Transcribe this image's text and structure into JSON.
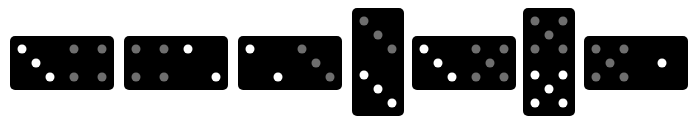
{
  "colors": {
    "tile": "#000000",
    "pip_white": "#ffffff",
    "pip_gray": "#6e6e6e",
    "background": "#ffffff"
  },
  "dominoes": [
    {
      "orientation": "horizontal",
      "x": 10,
      "y": 36,
      "halves": [
        {
          "value": 3,
          "color": "white"
        },
        {
          "value": 4,
          "color": "gray"
        }
      ]
    },
    {
      "orientation": "horizontal",
      "x": 124,
      "y": 36,
      "halves": [
        {
          "value": 4,
          "color": "gray"
        },
        {
          "value": 2,
          "color": "white"
        }
      ]
    },
    {
      "orientation": "horizontal",
      "x": 238,
      "y": 36,
      "halves": [
        {
          "value": 2,
          "color": "white"
        },
        {
          "value": 3,
          "color": "gray"
        }
      ]
    },
    {
      "orientation": "vertical",
      "x": 352,
      "y": 8,
      "halves": [
        {
          "value": 3,
          "color": "gray"
        },
        {
          "value": 3,
          "color": "white"
        }
      ]
    },
    {
      "orientation": "horizontal",
      "x": 412,
      "y": 36,
      "halves": [
        {
          "value": 3,
          "color": "white"
        },
        {
          "value": 5,
          "color": "gray"
        }
      ]
    },
    {
      "orientation": "vertical",
      "x": 523,
      "y": 8,
      "halves": [
        {
          "value": 5,
          "color": "gray"
        },
        {
          "value": 5,
          "color": "white"
        }
      ]
    },
    {
      "orientation": "horizontal",
      "x": 584,
      "y": 36,
      "halves": [
        {
          "value": 5,
          "color": "gray"
        },
        {
          "value": 1,
          "color": "white"
        }
      ]
    }
  ]
}
